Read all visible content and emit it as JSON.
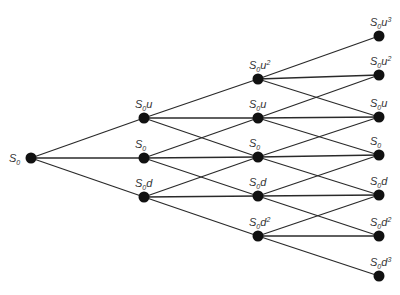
{
  "diagram": {
    "title": "",
    "type": "recombining binomial tree",
    "steps": 3,
    "colors": {
      "edge": "#2a2a2a",
      "node": "#111111",
      "label": "#333333",
      "background": "#ffffff"
    },
    "nodes": [
      {
        "id": "n0_0",
        "col": 0,
        "x": 31,
        "y": 158,
        "base": "S",
        "sub": "0",
        "var": "",
        "exp": "",
        "label": "S0"
      },
      {
        "id": "n1_0",
        "col": 1,
        "x": 144,
        "y": 118,
        "base": "S",
        "sub": "0",
        "var": "u",
        "exp": "",
        "label": "S0u"
      },
      {
        "id": "n1_1",
        "col": 1,
        "x": 144,
        "y": 158,
        "base": "S",
        "sub": "0",
        "var": "",
        "exp": "",
        "label": "S0"
      },
      {
        "id": "n1_2",
        "col": 1,
        "x": 144,
        "y": 197,
        "base": "S",
        "sub": "0",
        "var": "d",
        "exp": "",
        "label": "S0d"
      },
      {
        "id": "n2_0",
        "col": 2,
        "x": 258,
        "y": 79,
        "base": "S",
        "sub": "0",
        "var": "u",
        "exp": "2",
        "label": "S0u^2"
      },
      {
        "id": "n2_1",
        "col": 2,
        "x": 258,
        "y": 118,
        "base": "S",
        "sub": "0",
        "var": "u",
        "exp": "",
        "label": "S0u"
      },
      {
        "id": "n2_2",
        "col": 2,
        "x": 258,
        "y": 157,
        "base": "S",
        "sub": "0",
        "var": "",
        "exp": "",
        "label": "S0"
      },
      {
        "id": "n2_3",
        "col": 2,
        "x": 258,
        "y": 196,
        "base": "S",
        "sub": "0",
        "var": "d",
        "exp": "",
        "label": "S0d"
      },
      {
        "id": "n2_4",
        "col": 2,
        "x": 258,
        "y": 236,
        "base": "S",
        "sub": "0",
        "var": "d",
        "exp": "2",
        "label": "S0d^2"
      },
      {
        "id": "n3_0",
        "col": 3,
        "x": 379,
        "y": 36,
        "base": "S",
        "sub": "0",
        "var": "u",
        "exp": "3",
        "label": "S0u^3"
      },
      {
        "id": "n3_1",
        "col": 3,
        "x": 379,
        "y": 75,
        "base": "S",
        "sub": "0",
        "var": "u",
        "exp": "2",
        "label": "S0u^2"
      },
      {
        "id": "n3_2",
        "col": 3,
        "x": 379,
        "y": 117,
        "base": "S",
        "sub": "0",
        "var": "u",
        "exp": "",
        "label": "S0u"
      },
      {
        "id": "n3_3",
        "col": 3,
        "x": 379,
        "y": 155,
        "base": "S",
        "sub": "0",
        "var": "",
        "exp": "",
        "label": "S0"
      },
      {
        "id": "n3_4",
        "col": 3,
        "x": 379,
        "y": 195,
        "base": "S",
        "sub": "0",
        "var": "d",
        "exp": "",
        "label": "S0d"
      },
      {
        "id": "n3_5",
        "col": 3,
        "x": 379,
        "y": 236,
        "base": "S",
        "sub": "0",
        "var": "d",
        "exp": "2",
        "label": "S0d^2"
      },
      {
        "id": "n3_6",
        "col": 3,
        "x": 379,
        "y": 276,
        "base": "S",
        "sub": "0",
        "var": "d",
        "exp": "3",
        "label": "S0d^3"
      }
    ],
    "edges": [
      [
        "n0_0",
        "n1_0"
      ],
      [
        "n0_0",
        "n1_1"
      ],
      [
        "n0_0",
        "n1_2"
      ],
      [
        "n1_0",
        "n2_0"
      ],
      [
        "n1_0",
        "n2_1"
      ],
      [
        "n1_0",
        "n2_2"
      ],
      [
        "n1_1",
        "n2_1"
      ],
      [
        "n1_1",
        "n2_2"
      ],
      [
        "n1_1",
        "n2_3"
      ],
      [
        "n1_2",
        "n2_2"
      ],
      [
        "n1_2",
        "n2_3"
      ],
      [
        "n1_2",
        "n2_4"
      ],
      [
        "n2_0",
        "n3_0"
      ],
      [
        "n2_0",
        "n3_1"
      ],
      [
        "n2_0",
        "n3_2"
      ],
      [
        "n2_1",
        "n3_1"
      ],
      [
        "n2_1",
        "n3_2"
      ],
      [
        "n2_1",
        "n3_3"
      ],
      [
        "n2_2",
        "n3_2"
      ],
      [
        "n2_2",
        "n3_3"
      ],
      [
        "n2_2",
        "n3_4"
      ],
      [
        "n2_3",
        "n3_3"
      ],
      [
        "n2_3",
        "n3_4"
      ],
      [
        "n2_3",
        "n3_5"
      ],
      [
        "n2_4",
        "n3_4"
      ],
      [
        "n2_4",
        "n3_5"
      ],
      [
        "n2_4",
        "n3_6"
      ]
    ]
  }
}
